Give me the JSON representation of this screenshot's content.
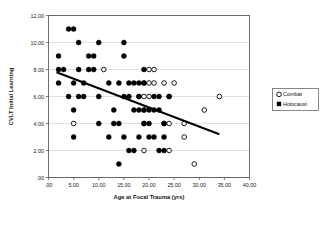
{
  "chart_data": {
    "type": "scatter",
    "title": "",
    "xlabel": "Age at Focal Trauma (yrs)",
    "ylabel": "CVLT Initial Learning",
    "xlim": [
      0,
      40
    ],
    "ylim": [
      0,
      12
    ],
    "grid": true,
    "legend_position": "right",
    "xticks": [
      0,
      5,
      10,
      15,
      20,
      25,
      30,
      35,
      40
    ],
    "xtick_labels": [
      ".00",
      "5.00",
      "10.00",
      "15.00",
      "20.00",
      "25.00",
      "30.00",
      "35.00",
      "40.00"
    ],
    "yticks": [
      0,
      2,
      4,
      6,
      8,
      10,
      12
    ],
    "ytick_labels": [
      ".00",
      "2.00",
      "4.00",
      "6.00",
      "8.00",
      "10.00",
      "12.00"
    ],
    "series": [
      {
        "name": "Combat",
        "marker": "open-circle",
        "color": "#ffffff",
        "edge_color": "#000000",
        "points": [
          [
            11,
            8
          ],
          [
            20,
            8
          ],
          [
            21,
            8
          ],
          [
            19,
            7
          ],
          [
            20,
            7
          ],
          [
            21,
            7
          ],
          [
            23,
            7
          ],
          [
            25,
            7
          ],
          [
            18,
            6
          ],
          [
            19,
            6
          ],
          [
            20,
            6
          ],
          [
            24,
            6
          ],
          [
            34,
            6
          ],
          [
            19,
            5
          ],
          [
            31,
            5
          ],
          [
            5,
            4
          ],
          [
            19,
            4
          ],
          [
            23,
            4
          ],
          [
            24,
            4
          ],
          [
            27,
            4
          ],
          [
            27,
            3
          ],
          [
            19,
            2
          ],
          [
            24,
            2
          ],
          [
            29,
            1
          ]
        ]
      },
      {
        "name": "Holocaust",
        "marker": "filled-circle",
        "color": "#000000",
        "edge_color": "#000000",
        "points": [
          [
            4,
            11
          ],
          [
            5,
            11
          ],
          [
            6,
            10
          ],
          [
            10,
            10
          ],
          [
            15,
            10
          ],
          [
            2,
            9
          ],
          [
            8,
            9
          ],
          [
            9,
            9
          ],
          [
            15,
            9
          ],
          [
            2,
            8
          ],
          [
            3,
            8
          ],
          [
            6,
            8
          ],
          [
            8,
            8
          ],
          [
            9,
            8
          ],
          [
            19,
            8
          ],
          [
            2,
            7
          ],
          [
            5,
            7
          ],
          [
            7,
            7
          ],
          [
            12,
            7
          ],
          [
            14,
            7
          ],
          [
            16,
            7
          ],
          [
            17,
            7
          ],
          [
            18,
            7
          ],
          [
            19,
            7
          ],
          [
            4,
            6
          ],
          [
            6,
            6
          ],
          [
            7,
            6
          ],
          [
            10,
            6
          ],
          [
            15,
            6
          ],
          [
            16,
            6
          ],
          [
            18,
            6
          ],
          [
            21,
            6
          ],
          [
            22,
            6
          ],
          [
            24,
            6
          ],
          [
            5,
            5
          ],
          [
            13,
            5
          ],
          [
            17,
            5
          ],
          [
            18,
            5
          ],
          [
            19,
            5
          ],
          [
            20,
            5
          ],
          [
            21,
            5
          ],
          [
            22,
            5
          ],
          [
            10,
            4
          ],
          [
            13,
            4
          ],
          [
            14,
            4
          ],
          [
            19,
            4
          ],
          [
            20,
            4
          ],
          [
            23,
            4
          ],
          [
            5,
            3
          ],
          [
            12,
            3
          ],
          [
            15,
            3
          ],
          [
            18,
            3
          ],
          [
            20,
            3
          ],
          [
            21,
            3
          ],
          [
            23,
            3
          ],
          [
            16,
            2
          ],
          [
            17,
            2
          ],
          [
            22,
            2
          ],
          [
            23,
            2
          ],
          [
            14,
            1
          ]
        ]
      }
    ],
    "trendline": {
      "x_start": 1.6,
      "y_start": 7.8,
      "x_end": 34.0,
      "y_end": 3.2
    }
  },
  "legend": {
    "entries": [
      {
        "label": "Combat",
        "marker": "open-circle"
      },
      {
        "label": "Holocaust",
        "marker": "filled-square"
      }
    ]
  }
}
